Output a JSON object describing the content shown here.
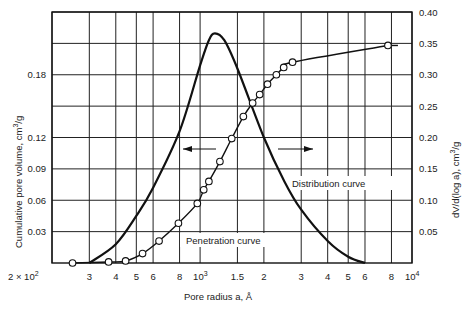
{
  "chart_data": {
    "type": "line",
    "title": "",
    "xlabel": "Pore radius a, Å",
    "ylabel_left": "Cumulative pore volume, cm³/g",
    "ylabel_right": "dV/d(log a), cm³/g",
    "x_scale": "log",
    "xlim": [
      200,
      10000
    ],
    "ylim_left": [
      0,
      0.24
    ],
    "ylim_right": [
      0,
      0.4
    ],
    "grid": true,
    "x_ticks": [
      {
        "value": 200,
        "label": "2 × 10",
        "sup": "2"
      },
      {
        "value": 300,
        "label": "3"
      },
      {
        "value": 400,
        "label": "4"
      },
      {
        "value": 500,
        "label": "5"
      },
      {
        "value": 600,
        "label": "6"
      },
      {
        "value": 800,
        "label": "8"
      },
      {
        "value": 1000,
        "label": "10",
        "sup": "3"
      },
      {
        "value": 1500,
        "label": "1.5"
      },
      {
        "value": 2000,
        "label": "2"
      },
      {
        "value": 3000,
        "label": "3"
      },
      {
        "value": 4000,
        "label": "4"
      },
      {
        "value": 5000,
        "label": "5"
      },
      {
        "value": 6000,
        "label": "6"
      },
      {
        "value": 8000,
        "label": "8"
      },
      {
        "value": 10000,
        "label": "10",
        "sup": "4"
      }
    ],
    "y_left_ticks": [
      {
        "value": 0.03,
        "label": "0.03"
      },
      {
        "value": 0.06,
        "label": "0.06"
      },
      {
        "value": 0.09,
        "label": "0.09"
      },
      {
        "value": 0.12,
        "label": "0.12"
      },
      {
        "value": 0.15,
        "label": ""
      },
      {
        "value": 0.18,
        "label": "0.18"
      },
      {
        "value": 0.21,
        "label": ""
      }
    ],
    "y_right_ticks": [
      {
        "value": 0.05,
        "label": "0.05"
      },
      {
        "value": 0.1,
        "label": "0.10"
      },
      {
        "value": 0.15,
        "label": "0.15"
      },
      {
        "value": 0.2,
        "label": "0.20"
      },
      {
        "value": 0.25,
        "label": "0.25"
      },
      {
        "value": 0.3,
        "label": "0.30"
      },
      {
        "value": 0.35,
        "label": "0.35"
      },
      {
        "value": 0.4,
        "label": "0.40"
      }
    ],
    "series": [
      {
        "name": "Penetration curve",
        "axis": "left",
        "style": "line+open-circles",
        "points": [
          {
            "x": 250,
            "y": 0.0
          },
          {
            "x": 370,
            "y": 0.001
          },
          {
            "x": 445,
            "y": 0.002
          },
          {
            "x": 535,
            "y": 0.009
          },
          {
            "x": 640,
            "y": 0.021
          },
          {
            "x": 790,
            "y": 0.038
          },
          {
            "x": 970,
            "y": 0.057
          },
          {
            "x": 1040,
            "y": 0.07
          },
          {
            "x": 1100,
            "y": 0.078
          },
          {
            "x": 1240,
            "y": 0.097
          },
          {
            "x": 1410,
            "y": 0.119
          },
          {
            "x": 1600,
            "y": 0.14
          },
          {
            "x": 1770,
            "y": 0.153
          },
          {
            "x": 1910,
            "y": 0.161
          },
          {
            "x": 2080,
            "y": 0.171
          },
          {
            "x": 2290,
            "y": 0.18
          },
          {
            "x": 2480,
            "y": 0.187
          },
          {
            "x": 2730,
            "y": 0.192
          },
          {
            "x": 7700,
            "y": 0.208
          }
        ]
      },
      {
        "name": "Distribution curve",
        "axis": "right",
        "style": "line",
        "points": [
          {
            "x": 300,
            "y": 0.0
          },
          {
            "x": 400,
            "y": 0.03
          },
          {
            "x": 500,
            "y": 0.075
          },
          {
            "x": 600,
            "y": 0.12
          },
          {
            "x": 800,
            "y": 0.21
          },
          {
            "x": 1000,
            "y": 0.315
          },
          {
            "x": 1100,
            "y": 0.355
          },
          {
            "x": 1175,
            "y": 0.366
          },
          {
            "x": 1300,
            "y": 0.355
          },
          {
            "x": 1500,
            "y": 0.31
          },
          {
            "x": 2000,
            "y": 0.2
          },
          {
            "x": 2500,
            "y": 0.13
          },
          {
            "x": 3000,
            "y": 0.085
          },
          {
            "x": 4000,
            "y": 0.035
          },
          {
            "x": 5000,
            "y": 0.01
          },
          {
            "x": 6000,
            "y": 0.0
          }
        ]
      }
    ],
    "annotations": [
      {
        "text": "Penetration curve",
        "near": {
          "x": 1400,
          "y_left": 0.025
        }
      },
      {
        "text": "Distribution curve",
        "near": {
          "x": 4500,
          "y_right": 0.12
        }
      },
      {
        "text": "←",
        "meaning": "penetration curve reads left axis"
      },
      {
        "text": "→",
        "meaning": "distribution curve reads right axis"
      }
    ]
  },
  "labels": {
    "xlabel": "Pore radius a, Å",
    "ylabel_left_main": "Cumulative pore volume, cm",
    "ylabel_left_sup": "3",
    "ylabel_left_tail": "/g",
    "ylabel_right_main": "dV/d(log a), cm",
    "ylabel_right_sup": "3",
    "ylabel_right_tail": "/g",
    "penetration_label": "Penetration curve",
    "distribution_label": "Distribution curve"
  }
}
